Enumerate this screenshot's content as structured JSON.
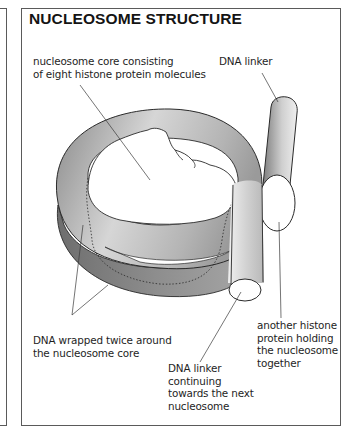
{
  "figure": {
    "title": "NUCLEOSOME STRUCTURE",
    "labels": {
      "core": {
        "lines": [
          "nucleosome core consisting",
          "of eight histone protein molecules"
        ]
      },
      "linker_top": {
        "lines": [
          "DNA linker"
        ]
      },
      "dna_wrapped": {
        "lines": [
          "DNA wrapped twice around",
          "the nucleosome core"
        ]
      },
      "linker_next": {
        "lines": [
          "DNA linker",
          "continuing",
          "towards the next",
          "nucleosome"
        ]
      },
      "histone_h1": {
        "lines": [
          "another histone",
          "protein holding",
          "the nucleosome",
          "together"
        ]
      }
    },
    "colors": {
      "border": "#5a5a5a",
      "outline": "#2a2a2a",
      "ring_light": "#e8e8e8",
      "ring_dark": "#7a7a7a",
      "text": "#1e1e1e"
    }
  }
}
